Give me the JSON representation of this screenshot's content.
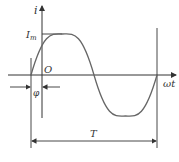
{
  "diagram": {
    "type": "sine-wave-phase",
    "labels": {
      "y_axis": "i",
      "amplitude": "I",
      "amplitude_sub": "m",
      "origin": "O",
      "x_axis": "ωt",
      "phase": "φ",
      "period": "T"
    },
    "colors": {
      "stroke": "#333333",
      "curve": "#555555",
      "background": "#ffffff"
    }
  }
}
